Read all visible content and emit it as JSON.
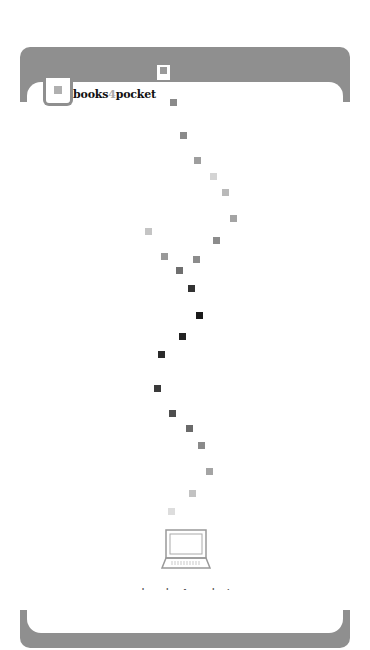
{
  "brand": {
    "name_part1": "books",
    "name_part2": "4",
    "name_part3": "pocket"
  },
  "footer": {
    "url": "www.books4pocket.com",
    "left_icon": "pointing-hand-right-icon",
    "right_icon": "pointing-hand-left-icon",
    "left_glyph": "☞",
    "right_glyph": "☜"
  },
  "colors": {
    "frame": "#8f8f8f",
    "background": "#ffffff"
  },
  "squares": [
    {
      "x": 160,
      "y": 67,
      "c": "#9a9a9a"
    },
    {
      "x": 170,
      "y": 99,
      "c": "#8a8a8a"
    },
    {
      "x": 180,
      "y": 132,
      "c": "#8a8a8a"
    },
    {
      "x": 194,
      "y": 157,
      "c": "#9e9e9e"
    },
    {
      "x": 210,
      "y": 173,
      "c": "#d4d4d4"
    },
    {
      "x": 222,
      "y": 189,
      "c": "#b9b9b9"
    },
    {
      "x": 230,
      "y": 215,
      "c": "#a4a4a4"
    },
    {
      "x": 213,
      "y": 237,
      "c": "#8c8c8c"
    },
    {
      "x": 145,
      "y": 228,
      "c": "#c4c4c4"
    },
    {
      "x": 161,
      "y": 253,
      "c": "#999999"
    },
    {
      "x": 193,
      "y": 256,
      "c": "#8c8c8c"
    },
    {
      "x": 176,
      "y": 267,
      "c": "#6f6f6f"
    },
    {
      "x": 188,
      "y": 285,
      "c": "#333333"
    },
    {
      "x": 196,
      "y": 312,
      "c": "#1a1a1a"
    },
    {
      "x": 179,
      "y": 333,
      "c": "#222222"
    },
    {
      "x": 158,
      "y": 351,
      "c": "#2a2a2a"
    },
    {
      "x": 154,
      "y": 385,
      "c": "#3a3a3a"
    },
    {
      "x": 169,
      "y": 410,
      "c": "#4e4e4e"
    },
    {
      "x": 186,
      "y": 425,
      "c": "#6a6a6a"
    },
    {
      "x": 198,
      "y": 442,
      "c": "#8a8a8a"
    },
    {
      "x": 206,
      "y": 468,
      "c": "#a4a4a4"
    },
    {
      "x": 189,
      "y": 490,
      "c": "#c2c2c2"
    },
    {
      "x": 168,
      "y": 508,
      "c": "#dddddd"
    }
  ]
}
